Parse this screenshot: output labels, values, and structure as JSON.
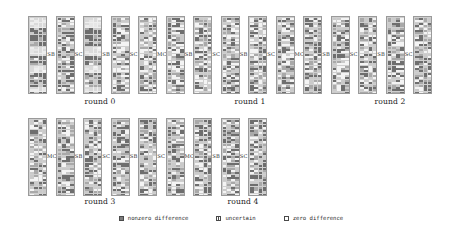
{
  "figure": {
    "type": "aes-differential-trail-state-diagram",
    "background": "#ffffff",
    "rows": [
      {
        "id": "row-top",
        "blocks": 15,
        "op_labels": [
          "SB",
          "SC",
          "SB",
          "SC",
          "MC",
          "SB",
          "SC",
          "SB",
          "SC",
          "MC",
          "SB",
          "SC",
          "SB",
          "SC"
        ],
        "round_labels": [
          {
            "text": "round 0",
            "center_x": 100
          },
          {
            "text": "round 1",
            "center_x": 250
          },
          {
            "text": "round 2",
            "center_x": 390
          }
        ]
      },
      {
        "id": "row-bottom",
        "blocks": 9,
        "op_labels": [
          "MC",
          "SB",
          "SC",
          "SB",
          "SC",
          "MC",
          "SB",
          "SC"
        ],
        "round_labels": [
          {
            "text": "round 3",
            "center_x": 100
          },
          {
            "text": "round 4",
            "center_x": 243
          }
        ]
      }
    ]
  },
  "legend": {
    "items": [
      {
        "key": "nonzero",
        "label": "nonzero difference",
        "swatch": "filled-dark-square"
      },
      {
        "key": "uncertain",
        "label": "uncertain",
        "swatch": "half-filled-square"
      },
      {
        "key": "zero",
        "label": "zero difference",
        "swatch": "empty-square"
      }
    ]
  },
  "colors": {
    "nonzero": "#7d7d7d",
    "uncertain": "#b4b4b4",
    "zero": "#ffffff",
    "border": "#9a9a9a",
    "text": "#2b2b2b"
  },
  "chart_data": {
    "type": "heatmap",
    "title": "",
    "xlabel": "",
    "ylabel": "",
    "legend_position": "bottom-center",
    "grid": true,
    "cell_states": [
      "nonzero difference",
      "uncertain",
      "zero difference"
    ],
    "block_grid": {
      "cols": 4,
      "rows": 32
    },
    "rows": [
      {
        "round_labels": [
          "round 0",
          "round 1",
          "round 2"
        ],
        "blocks": [
          {
            "index": 0,
            "density": 0.92,
            "dominant": "nonzero difference"
          },
          {
            "index": 1,
            "density": 0.58,
            "dominant": "uncertain"
          },
          {
            "index": 2,
            "density": 0.86,
            "dominant": "nonzero difference"
          },
          {
            "index": 3,
            "density": 0.44,
            "dominant": "uncertain"
          },
          {
            "index": 4,
            "density": 0.4,
            "dominant": "uncertain"
          },
          {
            "index": 5,
            "density": 0.46,
            "dominant": "uncertain"
          },
          {
            "index": 6,
            "density": 0.45,
            "dominant": "uncertain"
          },
          {
            "index": 7,
            "density": 0.47,
            "dominant": "uncertain"
          },
          {
            "index": 8,
            "density": 0.48,
            "dominant": "uncertain"
          },
          {
            "index": 9,
            "density": 0.49,
            "dominant": "uncertain"
          },
          {
            "index": 10,
            "density": 0.5,
            "dominant": "uncertain"
          },
          {
            "index": 11,
            "density": 0.5,
            "dominant": "uncertain"
          },
          {
            "index": 12,
            "density": 0.51,
            "dominant": "uncertain"
          },
          {
            "index": 13,
            "density": 0.52,
            "dominant": "uncertain"
          },
          {
            "index": 14,
            "density": 0.52,
            "dominant": "uncertain"
          }
        ]
      },
      {
        "round_labels": [
          "round 3",
          "round 4"
        ],
        "blocks": [
          {
            "index": 0,
            "density": 0.53,
            "dominant": "uncertain"
          },
          {
            "index": 1,
            "density": 0.53,
            "dominant": "uncertain"
          },
          {
            "index": 2,
            "density": 0.54,
            "dominant": "uncertain"
          },
          {
            "index": 3,
            "density": 0.54,
            "dominant": "uncertain"
          },
          {
            "index": 4,
            "density": 0.55,
            "dominant": "uncertain"
          },
          {
            "index": 5,
            "density": 0.55,
            "dominant": "uncertain"
          },
          {
            "index": 6,
            "density": 0.56,
            "dominant": "uncertain"
          },
          {
            "index": 7,
            "density": 0.56,
            "dominant": "uncertain"
          },
          {
            "index": 8,
            "density": 0.57,
            "dominant": "uncertain"
          }
        ]
      }
    ]
  }
}
